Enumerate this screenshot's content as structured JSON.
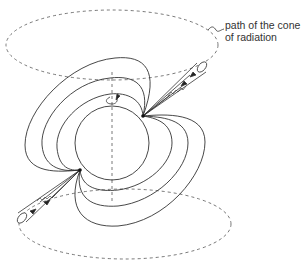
{
  "diagram": {
    "labels": {
      "cone_path_line1": "path of the cone",
      "cone_path_line2": "of radiation"
    },
    "colors": {
      "line": "#333333",
      "dashed": "#555555",
      "background": "#ffffff"
    },
    "elements": [
      "neutron-star-sphere",
      "rotation-axis",
      "rotation-arrow",
      "magnetic-field-lines",
      "radiation-beam-upper",
      "radiation-beam-lower",
      "cone-path-upper",
      "cone-path-lower"
    ]
  }
}
